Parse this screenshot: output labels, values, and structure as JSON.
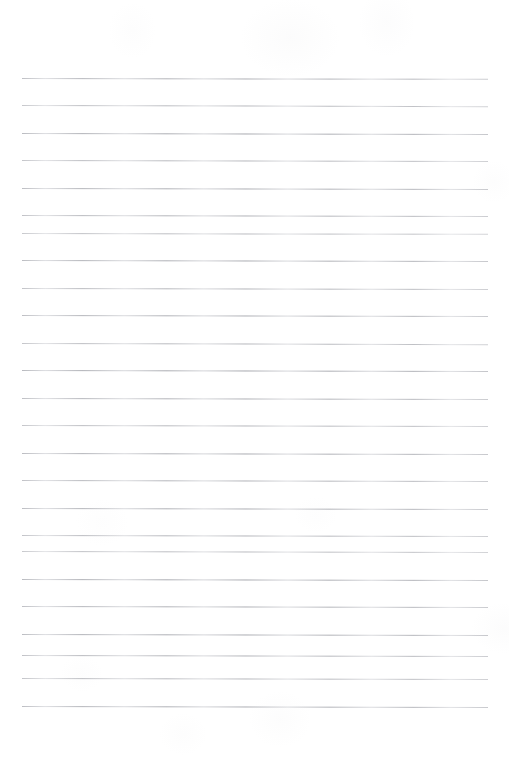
{
  "document": {
    "kind": "scanned-lined-notebook-page",
    "title": "Blank lined notebook page",
    "page_width": 509,
    "page_height": 757,
    "background_color": "#ffffff",
    "rule_color": "#8e9098",
    "content_text": "",
    "has_text": false,
    "has_handwriting": false,
    "has_header": false,
    "has_footer": false,
    "has_page_number": false,
    "has_margin_rule": false
  },
  "ruling": {
    "line_count": 24,
    "first_line_y": 78,
    "last_line_y": 706,
    "line_spacing": 27.3,
    "left_margin_x": 22,
    "right_margin_x": 488,
    "line_length": 466,
    "line_thickness": 1,
    "tilt_degrees": 0.12,
    "top_blank_space": 78,
    "bottom_blank_space": 51,
    "lines": [
      {
        "index": 1,
        "y": 78,
        "x1": 22,
        "x2": 488,
        "tilt": 0.1,
        "opacity": 0.72
      },
      {
        "index": 2,
        "y": 105,
        "x1": 22,
        "x2": 488,
        "tilt": 0.14,
        "opacity": 0.64
      },
      {
        "index": 3,
        "y": 133,
        "x1": 22,
        "x2": 488,
        "tilt": 0.12,
        "opacity": 0.78
      },
      {
        "index": 4,
        "y": 160,
        "x1": 22,
        "x2": 488,
        "tilt": 0.11,
        "opacity": 0.66
      },
      {
        "index": 5,
        "y": 188,
        "x1": 22,
        "x2": 488,
        "tilt": 0.13,
        "opacity": 0.74
      },
      {
        "index": 6,
        "y": 215,
        "x1": 22,
        "x2": 488,
        "tilt": 0.12,
        "opacity": 0.7
      },
      {
        "index": 7,
        "y": 233,
        "x1": 22,
        "x2": 488,
        "tilt": 0.1,
        "opacity": 0.62
      },
      {
        "index": 8,
        "y": 260,
        "x1": 22,
        "x2": 488,
        "tilt": 0.13,
        "opacity": 0.76
      },
      {
        "index": 9,
        "y": 288,
        "x1": 22,
        "x2": 488,
        "tilt": 0.12,
        "opacity": 0.68
      },
      {
        "index": 10,
        "y": 315,
        "x1": 22,
        "x2": 488,
        "tilt": 0.11,
        "opacity": 0.74
      },
      {
        "index": 11,
        "y": 343,
        "x1": 22,
        "x2": 488,
        "tilt": 0.14,
        "opacity": 0.66
      },
      {
        "index": 12,
        "y": 370,
        "x1": 22,
        "x2": 488,
        "tilt": 0.12,
        "opacity": 0.8
      },
      {
        "index": 13,
        "y": 398,
        "x1": 22,
        "x2": 488,
        "tilt": 0.13,
        "opacity": 0.72
      },
      {
        "index": 14,
        "y": 425,
        "x1": 22,
        "x2": 488,
        "tilt": 0.11,
        "opacity": 0.66
      },
      {
        "index": 15,
        "y": 453,
        "x1": 22,
        "x2": 488,
        "tilt": 0.12,
        "opacity": 0.76
      },
      {
        "index": 16,
        "y": 480,
        "x1": 22,
        "x2": 488,
        "tilt": 0.13,
        "opacity": 0.7
      },
      {
        "index": 17,
        "y": 508,
        "x1": 22,
        "x2": 488,
        "tilt": 0.12,
        "opacity": 0.74
      },
      {
        "index": 18,
        "y": 535,
        "x1": 22,
        "x2": 488,
        "tilt": 0.11,
        "opacity": 0.68
      },
      {
        "index": 19,
        "y": 551,
        "x1": 22,
        "x2": 488,
        "tilt": 0.13,
        "opacity": 0.62
      },
      {
        "index": 20,
        "y": 579,
        "x1": 22,
        "x2": 488,
        "tilt": 0.12,
        "opacity": 0.78
      },
      {
        "index": 21,
        "y": 606,
        "x1": 22,
        "x2": 488,
        "tilt": 0.11,
        "opacity": 0.72
      },
      {
        "index": 22,
        "y": 634,
        "x1": 22,
        "x2": 488,
        "tilt": 0.13,
        "opacity": 0.76
      },
      {
        "index": 23,
        "y": 655,
        "x1": 22,
        "x2": 488,
        "tilt": 0.12,
        "opacity": 0.7
      },
      {
        "index": 24,
        "y": 678,
        "x1": 22,
        "x2": 488,
        "tilt": 0.11,
        "opacity": 0.66
      },
      {
        "index": 25,
        "y": 706,
        "x1": 22,
        "x2": 488,
        "tilt": 0.13,
        "opacity": 0.74
      }
    ]
  }
}
